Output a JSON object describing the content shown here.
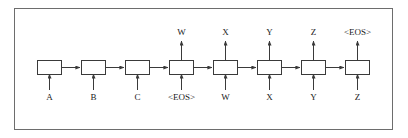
{
  "figure": {
    "type": "diagram",
    "frame": {
      "stroke": "#6d6d6d",
      "fill": "#ffffff"
    },
    "stroke_color": "#3a3a3a",
    "text_color": "#1a1a1a",
    "background": "#ffffff"
  },
  "cells": [
    {
      "id": "cell-1",
      "index": 1,
      "x": 37,
      "input": "A",
      "output": ""
    },
    {
      "id": "cell-2",
      "index": 2,
      "x": 81,
      "input": "B",
      "output": ""
    },
    {
      "id": "cell-3",
      "index": 3,
      "x": 125,
      "input": "C",
      "output": ""
    },
    {
      "id": "cell-4",
      "index": 4,
      "x": 169,
      "input": "<EOS>",
      "output": "W"
    },
    {
      "id": "cell-5",
      "index": 5,
      "x": 213,
      "input": "W",
      "output": "X"
    },
    {
      "id": "cell-6",
      "index": 6,
      "x": 257,
      "input": "X",
      "output": "Y"
    },
    {
      "id": "cell-7",
      "index": 7,
      "x": 301,
      "input": "Y",
      "output": "Z"
    },
    {
      "id": "cell-8",
      "index": 8,
      "x": 345,
      "input": "Z",
      "output": "<EOS>"
    }
  ],
  "inputs": {
    "label": "Input sequence",
    "tokens": [
      "A",
      "B",
      "C",
      "<EOS>",
      "W",
      "X",
      "Y",
      "Z"
    ]
  },
  "outputs": {
    "label": "Output sequence",
    "tokens": [
      "W",
      "X",
      "Y",
      "Z",
      "<EOS>"
    ]
  },
  "connections": {
    "recurrent_arrow": "horizontal-arrow",
    "input_arrow": "up-arrow",
    "output_arrow": "up-arrow",
    "count_horizontal": 7,
    "count_input": 8,
    "count_output": 5
  }
}
